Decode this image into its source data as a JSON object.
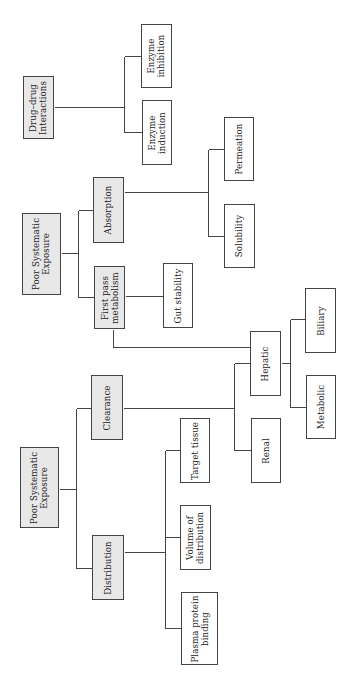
{
  "diagram": {
    "type": "tree",
    "orientation": "rotated-90-ccw",
    "colors": {
      "root_fill": "#e8e8e8",
      "leaf_fill": "#ffffff",
      "stroke": "#444444"
    },
    "nodes": {
      "ddi": {
        "label": "Drug–drug\nInteractions",
        "x": 23,
        "y": 76,
        "w": 31,
        "h": 63,
        "fill": "gray"
      },
      "inhibition": {
        "label": "Enzyme\ninhibition",
        "x": 141,
        "y": 24,
        "w": 31,
        "h": 64,
        "fill": "white"
      },
      "induction": {
        "label": "Enzyme\ninduction",
        "x": 142,
        "y": 100,
        "w": 30,
        "h": 65,
        "fill": "white"
      },
      "pse_top": {
        "label": "Poor Systematic\nExposure",
        "x": 22,
        "y": 213,
        "w": 39,
        "h": 82,
        "fill": "gray"
      },
      "absorption": {
        "label": "Absorption",
        "x": 93,
        "y": 177,
        "w": 31,
        "h": 66,
        "fill": "gray"
      },
      "firstpass": {
        "label": "First pass\nmetabolism",
        "x": 94,
        "y": 266,
        "w": 31,
        "h": 63,
        "fill": "gray"
      },
      "permeation": {
        "label": "Permeation",
        "x": 224,
        "y": 117,
        "w": 30,
        "h": 64,
        "fill": "white"
      },
      "solubility": {
        "label": "Solubility",
        "x": 224,
        "y": 204,
        "w": 31,
        "h": 64,
        "fill": "white"
      },
      "gut": {
        "label": "Gut stability",
        "x": 163,
        "y": 263,
        "w": 30,
        "h": 65,
        "fill": "white"
      },
      "pse_bottom": {
        "label": "Poor Systematic\nExposure",
        "x": 20,
        "y": 447,
        "w": 39,
        "h": 81,
        "fill": "gray"
      },
      "clearance": {
        "label": "Clearance",
        "x": 91,
        "y": 375,
        "w": 32,
        "h": 65,
        "fill": "gray"
      },
      "distribution": {
        "label": "Distribution",
        "x": 92,
        "y": 535,
        "w": 32,
        "h": 65,
        "fill": "gray"
      },
      "hepatic": {
        "label": "Hepatic",
        "x": 250,
        "y": 331,
        "w": 31,
        "h": 65,
        "fill": "white"
      },
      "renal": {
        "label": "Renal",
        "x": 251,
        "y": 418,
        "w": 30,
        "h": 65,
        "fill": "white"
      },
      "biliary": {
        "label": "Biliary",
        "x": 305,
        "y": 288,
        "w": 31,
        "h": 65,
        "fill": "white"
      },
      "metabolic": {
        "label": "Metabolic",
        "x": 306,
        "y": 375,
        "w": 30,
        "h": 64,
        "fill": "white"
      },
      "target": {
        "label": "Target tissue",
        "x": 180,
        "y": 418,
        "w": 30,
        "h": 65,
        "fill": "white"
      },
      "volume": {
        "label": "Volume of\ndistribution",
        "x": 180,
        "y": 505,
        "w": 31,
        "h": 65,
        "fill": "white"
      },
      "plasma": {
        "label": "Plasma protein\nbinding",
        "x": 181,
        "y": 592,
        "w": 37,
        "h": 73,
        "fill": "white"
      }
    },
    "edges": [
      {
        "from": "ddi",
        "to": "inhibition"
      },
      {
        "from": "ddi",
        "to": "induction"
      },
      {
        "from": "pse_top",
        "to": "absorption"
      },
      {
        "from": "pse_top",
        "to": "firstpass"
      },
      {
        "from": "absorption",
        "to": "permeation"
      },
      {
        "from": "absorption",
        "to": "solubility"
      },
      {
        "from": "firstpass",
        "to": "gut"
      },
      {
        "from": "firstpass",
        "to": "hepatic"
      },
      {
        "from": "pse_bottom",
        "to": "clearance"
      },
      {
        "from": "pse_bottom",
        "to": "distribution"
      },
      {
        "from": "clearance",
        "to": "hepatic"
      },
      {
        "from": "clearance",
        "to": "renal"
      },
      {
        "from": "hepatic",
        "to": "biliary"
      },
      {
        "from": "hepatic",
        "to": "metabolic"
      },
      {
        "from": "distribution",
        "to": "target"
      },
      {
        "from": "distribution",
        "to": "volume"
      },
      {
        "from": "distribution",
        "to": "plasma"
      }
    ],
    "connector_segments": [
      [
        54,
        107,
        124,
        107
      ],
      [
        124,
        56,
        124,
        132
      ],
      [
        124,
        56,
        141,
        56
      ],
      [
        124,
        132,
        142,
        132
      ],
      [
        61,
        253,
        78,
        253
      ],
      [
        78,
        210,
        78,
        297
      ],
      [
        78,
        210,
        93,
        210
      ],
      [
        78,
        297,
        94,
        297
      ],
      [
        124,
        192,
        208,
        192
      ],
      [
        208,
        149,
        208,
        236
      ],
      [
        208,
        149,
        224,
        149
      ],
      [
        208,
        236,
        224,
        236
      ],
      [
        125,
        296,
        163,
        296
      ],
      [
        113,
        329,
        113,
        347
      ],
      [
        113,
        347,
        250,
        347
      ],
      [
        59,
        489,
        76,
        489
      ],
      [
        76,
        408,
        76,
        568
      ],
      [
        76,
        408,
        91,
        408
      ],
      [
        76,
        568,
        92,
        568
      ],
      [
        123,
        408,
        234,
        408
      ],
      [
        234,
        363,
        234,
        450
      ],
      [
        234,
        363,
        250,
        363
      ],
      [
        234,
        450,
        251,
        450
      ],
      [
        281,
        363,
        290,
        363
      ],
      [
        290,
        319,
        290,
        407
      ],
      [
        290,
        319,
        305,
        319
      ],
      [
        290,
        407,
        306,
        407
      ],
      [
        124,
        552,
        165,
        552
      ],
      [
        165,
        450,
        165,
        628
      ],
      [
        165,
        450,
        180,
        450
      ],
      [
        165,
        537,
        180,
        537
      ],
      [
        165,
        628,
        181,
        628
      ]
    ]
  }
}
